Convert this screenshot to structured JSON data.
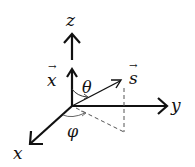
{
  "diagram": {
    "type": "3d-coordinate-system",
    "axes": {
      "x_label": "x",
      "y_label": "y",
      "z_label": "z"
    },
    "vectors": {
      "x_vec_label": "x",
      "s_vec_label": "s",
      "vector_arrow_glyph": "→"
    },
    "angles": {
      "theta_label": "θ",
      "phi_label": "φ"
    },
    "colors": {
      "stroke": "#111111",
      "dashed": "#555555",
      "background": "#ffffff"
    }
  }
}
